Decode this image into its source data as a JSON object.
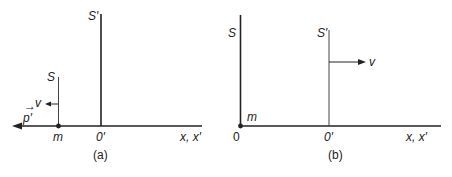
{
  "figure": {
    "colors": {
      "background": "#ffffff",
      "ink": "#222222"
    },
    "panel_a": {
      "caption": "(a)",
      "frame_S_label": "S",
      "frame_S_prime_label": "S′",
      "velocity_label": "v",
      "velocity_direction": "left",
      "momentum_label": "p′",
      "momentum_vector_mark": "→",
      "momentum_direction": "left",
      "mass_label": "m",
      "origin_prime_label": "0′",
      "axis_label": "x, x′"
    },
    "panel_b": {
      "caption": "(b)",
      "frame_S_label": "S",
      "frame_S_prime_label": "S′",
      "velocity_label": "v",
      "velocity_direction": "right",
      "mass_label": "m",
      "origin_label": "0",
      "origin_prime_label": "0′",
      "axis_label": "x, x′"
    }
  }
}
